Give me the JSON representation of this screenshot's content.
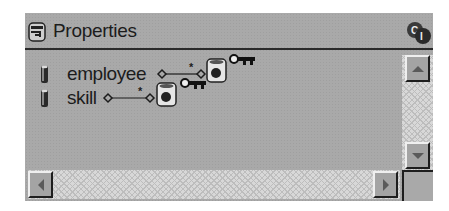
{
  "panel": {
    "title": "Properties",
    "icons": {
      "title_icon": "database-key-icon",
      "corner_icon": "class-interface-icon"
    },
    "ci_label": "CI"
  },
  "rows": [
    {
      "label": "employee",
      "icon": "column-cylinder-icon",
      "multiplicity": "*",
      "target_icon": "database-table-icon",
      "key_icon": "key-icon"
    },
    {
      "label": "skill",
      "icon": "column-cylinder-icon",
      "multiplicity": "*",
      "target_icon": "database-table-icon",
      "key_icon": "key-icon"
    }
  ],
  "scrollbars": {
    "vertical": {
      "up": "scroll-up",
      "down": "scroll-down"
    },
    "horizontal": {
      "left": "scroll-left",
      "right": "scroll-right"
    }
  },
  "colors": {
    "panel_bg": "#a9a9a9",
    "border_dark": "#1e1e1e",
    "text": "#1c1c1c",
    "scroll_track": "#d8d8d8"
  }
}
